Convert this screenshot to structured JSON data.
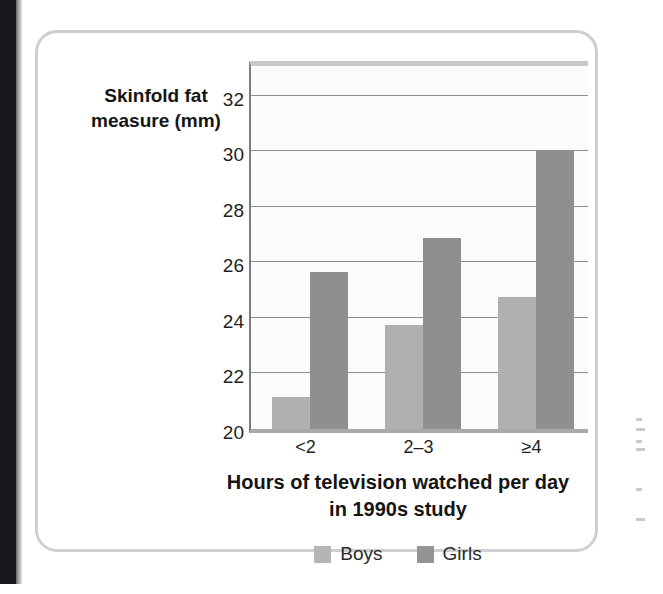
{
  "figure": {
    "y_axis_title": "Skinfold fat measure (mm)",
    "y_axis_title_line1": "Skinfold fat",
    "y_axis_title_line2": "measure (mm)",
    "x_axis_title_line1": "Hours of television watched per day",
    "x_axis_title_line2": "in 1990s study"
  },
  "legend": {
    "items": [
      {
        "label": "Boys",
        "color": "#b5b5b5"
      },
      {
        "label": "Girls",
        "color": "#949494"
      }
    ]
  },
  "colors": {
    "boys_bar": "#b0b0b0",
    "girls_bar": "#8f8f8f",
    "gridline": "#8d8d91",
    "axis": "#7c7c80",
    "card_border": "#cfcfd2",
    "plot_background": "#fbfbfb"
  },
  "margin_notes": [
    "",
    "",
    "",
    "",
    ""
  ],
  "chart_data": {
    "type": "bar",
    "title": "",
    "categories": [
      "<2",
      "2–3",
      "≥4"
    ],
    "series": [
      {
        "name": "Boys",
        "color": "#b0b0b0",
        "values": [
          21.2,
          23.8,
          24.8
        ]
      },
      {
        "name": "Girls",
        "color": "#8f8f8f",
        "values": [
          25.7,
          26.9,
          30.1
        ]
      }
    ],
    "xlabel": "Hours of television watched per day in 1990s study",
    "ylabel": "Skinfold fat measure (mm)",
    "ylim": [
      20,
      33.4
    ],
    "yticks": [
      20,
      22,
      24,
      26,
      28,
      30,
      32
    ],
    "ytick_labels": [
      "20",
      "22",
      "24",
      "26",
      "28",
      "30",
      "32"
    ],
    "grid": true,
    "grid_axis": "y",
    "legend_position": "bottom",
    "bar_group_mode": "grouped"
  }
}
